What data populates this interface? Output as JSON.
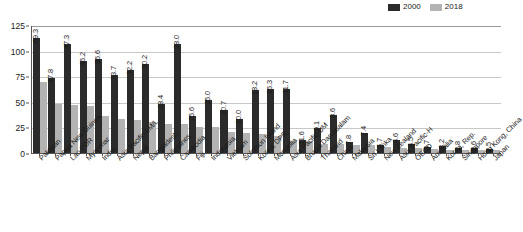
{
  "chart_data": {
    "type": "bar",
    "title": "",
    "xlabel": "",
    "ylabel": "",
    "ylim": [
      0,
      125
    ],
    "yticks": [
      0,
      25,
      50,
      75,
      100,
      125
    ],
    "grid": true,
    "legend_position": "top-right",
    "legend": [
      "2000",
      "2018"
    ],
    "colors": {
      "2000": "#2b2b2b",
      "2018": "#b3b3b3"
    },
    "label_series": "2018",
    "categories": [
      "Pakistan",
      "Papua New Guinea",
      "Lao PDR",
      "Myanmar",
      "India",
      "Asia Pacific-LM/L",
      "Nepal",
      "Bangladesh",
      "Philippines",
      "Cambodia",
      "Fiji",
      "Indonesia",
      "Vietnam",
      "Solomon Island",
      "Korea, DPR",
      "Mongolia",
      "Asia Pacific-UM",
      "Brunei Darussalam",
      "Thailand",
      "China",
      "Malaysia",
      "Sri Lanka",
      "New Zealand",
      "Asia Pacific-H",
      "OECD",
      "Australia",
      "Korea, Rep.",
      "Singapore",
      "Hong Kong, China",
      "Japan"
    ],
    "series": [
      {
        "name": "2000",
        "values": [
          112.0,
          73.0,
          106.5,
          89.5,
          92.0,
          76.0,
          81.0,
          87.0,
          47.5,
          106.5,
          36.0,
          52.0,
          42.0,
          33.0,
          62.0,
          62.5,
          63.0,
          12.5,
          24.0,
          37.0,
          11.0,
          20.0,
          8.0,
          12.5,
          9.0,
          6.0,
          7.0,
          5.0,
          4.5,
          4.0
        ]
      },
      {
        "name": "2018",
        "values": [
          69.3,
          47.8,
          47.3,
          46.2,
          36.6,
          33.7,
          32.2,
          30.2,
          28.4,
          28.0,
          25.6,
          25.0,
          20.7,
          20.0,
          18.2,
          16.3,
          11.7,
          11.6,
          9.1,
          8.6,
          7.8,
          7.4,
          5.7,
          4.6,
          4.5,
          3.7,
          3.2,
          2.8,
          2.6,
          2.5
        ]
      }
    ],
    "data_labels": [
      "69.3",
      "47.8",
      "47.3",
      "46.2",
      "36.6",
      "33.7",
      "32.2",
      "30.2",
      "28.4",
      "28.0",
      "25.6",
      "25.0",
      "20.7",
      "20.0",
      "18.2",
      "16.3",
      "11.7",
      "11.6",
      "9.1",
      "8.6",
      "7.8",
      "7.4",
      "5.7",
      "4.6",
      "4.5",
      "3.7",
      "3.2",
      "2.8",
      "2.6",
      "2.5"
    ]
  }
}
